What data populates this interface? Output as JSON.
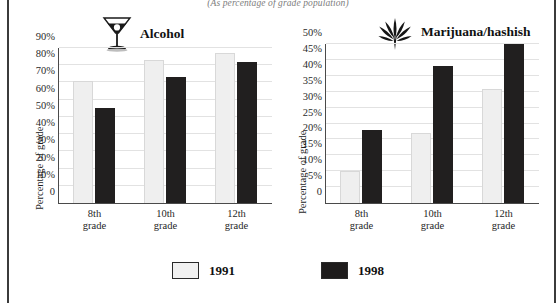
{
  "super_title": "(As percentage of grade population)",
  "axis_title": "Percentage of grade",
  "legend": {
    "items": [
      {
        "label": "1991",
        "color": "#f1f1f1",
        "icon": "legend-swatch-light"
      },
      {
        "label": "1998",
        "color": "#1e1c1c",
        "icon": "legend-swatch-dark"
      }
    ]
  },
  "panels": [
    {
      "title": "Alcohol",
      "icon": "martini-glass-icon"
    },
    {
      "title": "Marijuana/hashish",
      "icon": "cannabis-leaf-icon"
    }
  ],
  "chart_data": [
    {
      "type": "bar",
      "title": "Alcohol",
      "subtitle": "(As percentage of grade population)",
      "xlabel": "",
      "ylabel": "Percentage of grade",
      "categories": [
        "8th grade",
        "10th grade",
        "12th grade"
      ],
      "tick_labels": [
        "0",
        "10%",
        "20%",
        "30%",
        "40%",
        "50%",
        "60%",
        "70%",
        "80%",
        "90%"
      ],
      "ylim": [
        0,
        90
      ],
      "ytick_step": 10,
      "grid": true,
      "legend_position": "bottom",
      "series": [
        {
          "name": "1991",
          "color": "#f1f1f1",
          "values": [
            71,
            83,
            87
          ]
        },
        {
          "name": "1998",
          "color": "#1e1c1c",
          "values": [
            55,
            73,
            82
          ]
        }
      ]
    },
    {
      "type": "bar",
      "title": "Marijuana/hashish",
      "subtitle": "(As percentage of grade population)",
      "xlabel": "",
      "ylabel": "Percentage of grade",
      "categories": [
        "8th grade",
        "10th grade",
        "12th grade"
      ],
      "tick_labels": [
        "0",
        "5%",
        "10%",
        "15%",
        "20%",
        "25%",
        "30%",
        "35%",
        "40%",
        "45%",
        "50%"
      ],
      "ylim": [
        0,
        50
      ],
      "ytick_step": 5,
      "grid": true,
      "legend_position": "bottom",
      "series": [
        {
          "name": "1991",
          "color": "#f1f1f1",
          "values": [
            10,
            22,
            36
          ]
        },
        {
          "name": "1998",
          "color": "#1e1c1c",
          "values": [
            23,
            43,
            50
          ]
        }
      ]
    }
  ]
}
